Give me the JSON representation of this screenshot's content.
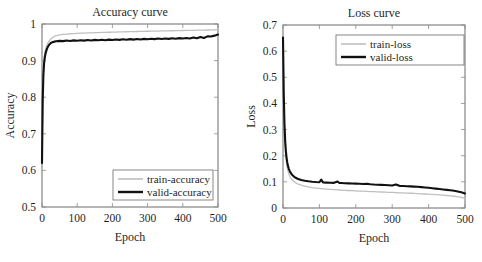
{
  "figure": {
    "background": "#ffffff",
    "panels": [
      "accuracy",
      "loss"
    ]
  },
  "chart_data": [
    {
      "type": "line",
      "id": "accuracy",
      "title": "Accuracy curve",
      "xlabel": "Epoch",
      "ylabel": "Accuracy",
      "xlim": [
        0,
        500
      ],
      "ylim": [
        0.5,
        1
      ],
      "xticks": [
        0,
        100,
        200,
        300,
        400,
        500
      ],
      "xtick_labels": [
        "0",
        "100",
        "200",
        "300",
        "400",
        "500"
      ],
      "yticks": [
        0.5,
        0.6,
        0.7,
        0.8,
        0.9,
        1
      ],
      "ytick_labels": [
        "0.5",
        "0.6",
        "0.7",
        "0.8",
        "0.9",
        "1"
      ],
      "grid": false,
      "legend_position": "lower right",
      "x": [
        0,
        2,
        4,
        6,
        8,
        10,
        12,
        14,
        16,
        18,
        20,
        25,
        30,
        35,
        40,
        50,
        60,
        70,
        80,
        90,
        100,
        110,
        120,
        130,
        140,
        150,
        160,
        170,
        180,
        190,
        200,
        210,
        220,
        230,
        240,
        250,
        260,
        270,
        280,
        290,
        300,
        310,
        320,
        330,
        340,
        350,
        360,
        370,
        380,
        390,
        400,
        410,
        420,
        430,
        440,
        450,
        460,
        470,
        480,
        490,
        500
      ],
      "series": [
        {
          "name": "train-accuracy",
          "color": "#bfbfbf",
          "values": [
            0.62,
            0.806,
            0.878,
            0.906,
            0.921,
            0.931,
            0.937,
            0.942,
            0.946,
            0.95,
            0.953,
            0.959,
            0.963,
            0.966,
            0.968,
            0.9705,
            0.9718,
            0.9726,
            0.9733,
            0.9739,
            0.9744,
            0.9748,
            0.9752,
            0.9756,
            0.976,
            0.9763,
            0.9766,
            0.9769,
            0.9772,
            0.9775,
            0.9778,
            0.978,
            0.9783,
            0.9785,
            0.9788,
            0.979,
            0.9793,
            0.9795,
            0.9797,
            0.98,
            0.9802,
            0.9804,
            0.9806,
            0.9808,
            0.981,
            0.9812,
            0.9814,
            0.9816,
            0.9818,
            0.982,
            0.9822,
            0.9824,
            0.9826,
            0.9828,
            0.983,
            0.9832,
            0.9834,
            0.9836,
            0.9838,
            0.984,
            0.9845
          ]
        },
        {
          "name": "valid-accuracy",
          "color": "#111111",
          "values": [
            0.62,
            0.79,
            0.862,
            0.893,
            0.909,
            0.919,
            0.926,
            0.932,
            0.936,
            0.94,
            0.943,
            0.948,
            0.9505,
            0.9518,
            0.9528,
            0.954,
            0.9532,
            0.9548,
            0.9535,
            0.9552,
            0.9541,
            0.9558,
            0.9546,
            0.9562,
            0.955,
            0.9566,
            0.9554,
            0.957,
            0.9558,
            0.9574,
            0.9562,
            0.9578,
            0.9566,
            0.9582,
            0.957,
            0.9586,
            0.9574,
            0.959,
            0.9578,
            0.9594,
            0.9582,
            0.9598,
            0.9586,
            0.9602,
            0.959,
            0.9606,
            0.9594,
            0.961,
            0.9598,
            0.9614,
            0.9602,
            0.9618,
            0.9606,
            0.9634,
            0.961,
            0.9646,
            0.9618,
            0.9662,
            0.9658,
            0.9682,
            0.9712
          ]
        }
      ]
    },
    {
      "type": "line",
      "id": "loss",
      "title": "Loss curve",
      "xlabel": "Epoch",
      "ylabel": "Loss",
      "xlim": [
        0,
        500
      ],
      "ylim": [
        0,
        0.7
      ],
      "xticks": [
        0,
        100,
        200,
        300,
        400,
        500
      ],
      "xtick_labels": [
        "0",
        "100",
        "200",
        "300",
        "400",
        "500"
      ],
      "yticks": [
        0,
        0.1,
        0.2,
        0.3,
        0.4,
        0.5,
        0.6,
        0.7
      ],
      "ytick_labels": [
        "0",
        "0.1",
        "0.2",
        "0.3",
        "0.4",
        "0.5",
        "0.6",
        "0.7"
      ],
      "grid": false,
      "legend_position": "upper right",
      "x": [
        0,
        2,
        4,
        6,
        8,
        10,
        12,
        14,
        16,
        18,
        20,
        25,
        30,
        35,
        40,
        50,
        60,
        70,
        80,
        90,
        100,
        105,
        110,
        120,
        130,
        140,
        150,
        155,
        160,
        170,
        180,
        190,
        200,
        210,
        220,
        230,
        240,
        250,
        260,
        270,
        280,
        290,
        300,
        310,
        320,
        330,
        340,
        350,
        360,
        370,
        380,
        390,
        400,
        410,
        420,
        430,
        440,
        450,
        460,
        470,
        480,
        490,
        500
      ],
      "series": [
        {
          "name": "train-loss",
          "color": "#bfbfbf",
          "values": [
            0.652,
            0.42,
            0.3,
            0.235,
            0.196,
            0.17,
            0.152,
            0.14,
            0.131,
            0.124,
            0.118,
            0.108,
            0.101,
            0.0962,
            0.0925,
            0.0872,
            0.0835,
            0.0806,
            0.0783,
            0.0764,
            0.0748,
            0.0741,
            0.0734,
            0.0722,
            0.0711,
            0.0701,
            0.0692,
            0.0688,
            0.0684,
            0.0676,
            0.0669,
            0.0662,
            0.0655,
            0.0648,
            0.0642,
            0.0636,
            0.063,
            0.0624,
            0.0618,
            0.0612,
            0.0606,
            0.06,
            0.0594,
            0.0588,
            0.0582,
            0.0576,
            0.057,
            0.0564,
            0.0557,
            0.055,
            0.0543,
            0.0536,
            0.0528,
            0.052,
            0.0511,
            0.0501,
            0.049,
            0.0478,
            0.0465,
            0.045,
            0.0432,
            0.0408,
            0.0368
          ]
        },
        {
          "name": "valid-loss",
          "color": "#111111",
          "values": [
            0.652,
            0.44,
            0.322,
            0.256,
            0.216,
            0.19,
            0.172,
            0.159,
            0.15,
            0.143,
            0.137,
            0.127,
            0.12,
            0.1155,
            0.112,
            0.1072,
            0.1042,
            0.102,
            0.1004,
            0.0992,
            0.0984,
            0.1085,
            0.0978,
            0.0972,
            0.0966,
            0.0962,
            0.1015,
            0.0958,
            0.0954,
            0.0948,
            0.0942,
            0.0938,
            0.0932,
            0.0926,
            0.0918,
            0.0925,
            0.0908,
            0.0898,
            0.0892,
            0.0884,
            0.0878,
            0.087,
            0.0862,
            0.0902,
            0.0848,
            0.0842,
            0.0834,
            0.0826,
            0.0818,
            0.081,
            0.0798,
            0.0786,
            0.0772,
            0.0756,
            0.0742,
            0.0726,
            0.071,
            0.0694,
            0.0676,
            0.0658,
            0.0634,
            0.0606,
            0.0558
          ]
        }
      ]
    }
  ]
}
